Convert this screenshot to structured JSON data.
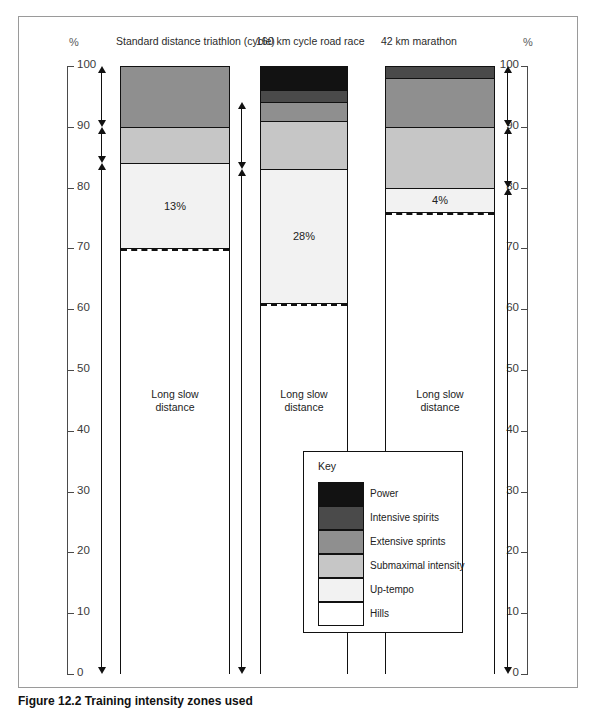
{
  "figure": {
    "caption": "Figure 12.2  Training intensity zones used",
    "axis_unit": "%"
  },
  "chart_data": {
    "type": "bar",
    "title": "",
    "subtitle": "",
    "xlabel": "",
    "ylabel": "%",
    "ylim": [
      0,
      100
    ],
    "grid": false,
    "stacked": true,
    "tick_labels": [
      "0",
      "10",
      "20",
      "30",
      "40",
      "50",
      "60",
      "70",
      "80",
      "90",
      "100"
    ],
    "tick_values": [
      0,
      10,
      20,
      30,
      40,
      50,
      60,
      70,
      80,
      90,
      100
    ],
    "legend_position": "inside-bottom-center",
    "legend_title": "Key",
    "categories": [
      "Standard distance triathlon (cycle)",
      "160 km cycle road race",
      "42 km marathon"
    ],
    "series": [
      {
        "name": "Hills",
        "color": "#ffffff",
        "values": [
          70,
          61,
          76
        ]
      },
      {
        "name": "Up-tempo",
        "color": "#f2f2f2",
        "values": [
          14,
          22,
          4
        ]
      },
      {
        "name": "Submaximal intensity",
        "color": "#c6c6c6",
        "values": [
          6,
          8,
          10
        ]
      },
      {
        "name": "Extensive sprints",
        "color": "#8f8f8f",
        "values": [
          10,
          3,
          8
        ]
      },
      {
        "name": "Intensive spirits",
        "color": "#4a4a4a",
        "values": [
          0,
          2,
          2
        ]
      },
      {
        "name": "Power",
        "color": "#121212",
        "values": [
          0,
          4,
          0
        ]
      }
    ],
    "annotations": [
      {
        "bar": "Standard distance triathlon (cycle)",
        "text": "13%",
        "at_pct": 77
      },
      {
        "bar": "Standard distance triathlon (cycle)",
        "text": "Long slow distance",
        "at_pct": 46
      },
      {
        "bar": "160 km cycle road race",
        "text": "28%",
        "at_pct": 72
      },
      {
        "bar": "160 km cycle road race",
        "text": "Long slow distance",
        "at_pct": 46
      },
      {
        "bar": "42 km marathon",
        "text": "4%",
        "at_pct": 78
      },
      {
        "bar": "42 km marathon",
        "text": "Long slow distance",
        "at_pct": 46
      }
    ],
    "dashed_markers": [
      {
        "bar": "Standard distance triathlon (cycle)",
        "at_pct": 70
      },
      {
        "bar": "160 km cycle road race",
        "at_pct": 61
      },
      {
        "bar": "42 km marathon",
        "at_pct": 76
      }
    ]
  },
  "legend": {
    "title": "Key",
    "items": [
      {
        "label": "Power",
        "color": "#121212"
      },
      {
        "label": "Intensive spirits",
        "color": "#4a4a4a"
      },
      {
        "label": "Extensive sprints",
        "color": "#8f8f8f"
      },
      {
        "label": "Submaximal intensity",
        "color": "#c6c6c6"
      },
      {
        "label": "Up-tempo",
        "color": "#f2f2f2"
      },
      {
        "label": "Hills",
        "color": "#ffffff"
      }
    ]
  },
  "axes": {
    "left": {
      "unit": "%",
      "labels": [
        "100",
        "90",
        "80",
        "70",
        "60",
        "50",
        "40",
        "30",
        "20",
        "10",
        "0"
      ]
    },
    "right": {
      "unit": "%",
      "labels": [
        "100",
        "90",
        "80",
        "70",
        "60",
        "50",
        "40",
        "30",
        "20",
        "10",
        "0"
      ]
    }
  },
  "arrows": {
    "left_ranges": [
      [
        100,
        90
      ],
      [
        90,
        84
      ],
      [
        84,
        0
      ]
    ],
    "mid_ranges": [
      [
        94,
        83
      ],
      [
        83,
        0
      ]
    ],
    "right_ranges": [
      [
        100,
        90
      ],
      [
        90,
        80
      ],
      [
        80,
        0
      ]
    ]
  }
}
